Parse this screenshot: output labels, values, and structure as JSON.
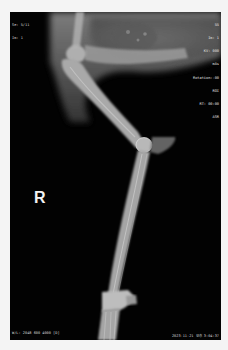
{
  "viewer": {
    "background_color": "#f4f4f4",
    "image_background": "#020202"
  },
  "overlay": {
    "top_left": {
      "series": "Se: 5/11",
      "image": "Im: 1"
    },
    "top_right": {
      "lines": [
        "55",
        "Im: 1",
        "KV: 000",
        "mAs",
        "Rotation:-00",
        "ROI",
        "RT: 00:00",
        "ASR"
      ]
    },
    "bottom_left": {
      "window": "W/L: 2048 600 4000 [D]"
    },
    "bottom_right": {
      "datetime": "2023-11-21 오후 3:04:37"
    }
  },
  "image": {
    "side_marker": "R",
    "subject": "limb radiograph (lateral view)"
  }
}
